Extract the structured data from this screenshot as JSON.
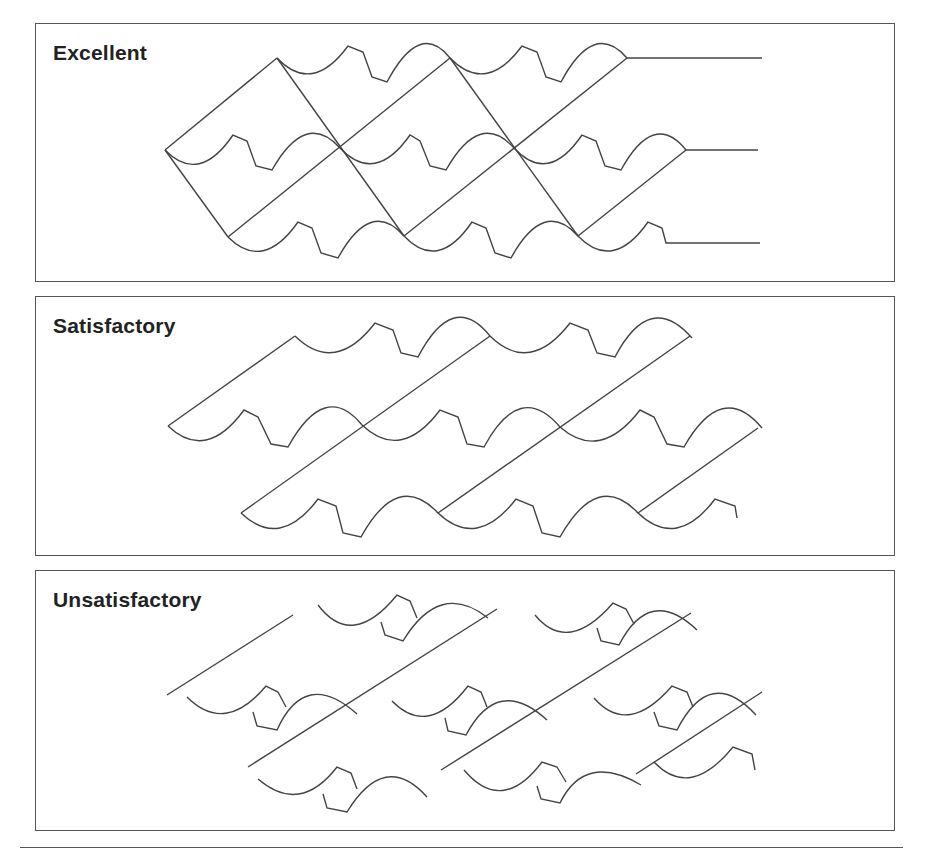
{
  "figure": {
    "panels": [
      {
        "id": "excellent",
        "label": "Excellent"
      },
      {
        "id": "satisfactory",
        "label": "Satisfactory"
      },
      {
        "id": "unsatisfactory",
        "label": "Unsatisfactory"
      }
    ]
  },
  "colors": {
    "stroke": "#444444",
    "border": "#555555",
    "text": "#222222",
    "background": "#ffffff"
  }
}
